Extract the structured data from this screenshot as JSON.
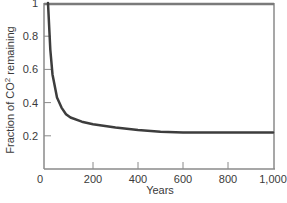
{
  "chart_data": {
    "type": "line",
    "title": "",
    "xlabel": "Years",
    "ylabel": "Fraction of CO² remaining",
    "xlim": [
      0,
      1000
    ],
    "ylim": [
      0,
      1
    ],
    "grid": false,
    "legend": null,
    "x_ticks": [
      0,
      200,
      400,
      600,
      800,
      1000
    ],
    "x_tick_labels": [
      "0",
      "200",
      "400",
      "600",
      "800",
      "1,000"
    ],
    "y_ticks": [
      0.2,
      0.4,
      0.6,
      0.8,
      1
    ],
    "y_tick_labels": [
      "0.2",
      "0.4",
      "0.6",
      "0.8",
      "1"
    ],
    "series": [
      {
        "name": "CO2 fraction remaining",
        "x": [
          0,
          10,
          20,
          40,
          60,
          80,
          100,
          150,
          200,
          300,
          400,
          500,
          600,
          800,
          1000
        ],
        "y": [
          1.0,
          0.72,
          0.57,
          0.43,
          0.37,
          0.33,
          0.31,
          0.285,
          0.27,
          0.25,
          0.235,
          0.225,
          0.22,
          0.22,
          0.22
        ]
      }
    ],
    "reference_line": {
      "y": 1.0,
      "description": "top horizontal line at fraction 1"
    }
  },
  "colors": {
    "axis": "#8a8a8a",
    "curve": "#3d3d3d",
    "reference": "#7a7a7a",
    "text": "#3a3a3a"
  }
}
